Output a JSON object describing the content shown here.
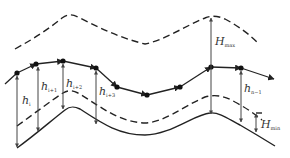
{
  "diagram": {
    "type": "terrain-following flight path diagram",
    "colors": {
      "line": "#222222",
      "thin_line": "#555555",
      "text": "#333333"
    },
    "curves": {
      "upper_envelope": {
        "style": "dashed",
        "description": "upper limit curve (terrain + Hmax)"
      },
      "flight_path": {
        "style": "solid with waypoints and arrows",
        "description": "planned path polyline"
      },
      "lower_envelope": {
        "style": "dashed",
        "description": "lower limit curve (terrain + Hmin)"
      },
      "terrain": {
        "style": "solid",
        "description": "terrain profile"
      }
    },
    "labels": {
      "h_i": {
        "main": "h",
        "sub": "i"
      },
      "h_i1": {
        "main": "h",
        "sub": "i+1"
      },
      "h_i2": {
        "main": "h",
        "sub": "i+2"
      },
      "h_i3": {
        "main": "h",
        "sub": "i+3"
      },
      "h_n1": {
        "main": "h",
        "sub": "n−1"
      },
      "H_max": {
        "main": "H",
        "sub": "max"
      },
      "H_min": {
        "main": "H",
        "sub": "min"
      }
    }
  }
}
